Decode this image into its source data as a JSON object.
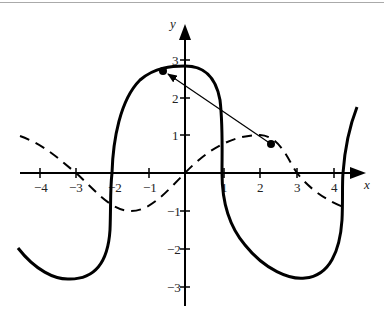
{
  "axes": {
    "x_label": "x",
    "y_label": "y",
    "x_ticks": [
      "−4",
      "−3",
      "−2",
      "−1",
      "1",
      "2",
      "3",
      "4"
    ],
    "y_ticks": [
      "3",
      "2",
      "1",
      "−1",
      "−2",
      "−3"
    ]
  },
  "curves": {
    "solid": {
      "style": "thick solid",
      "color": "#000000"
    },
    "dashed": {
      "style": "dashed",
      "color": "#000000"
    }
  },
  "arrow": {
    "from": [
      2.3,
      0.75
    ],
    "to": [
      -0.6,
      2.7
    ],
    "color": "#000000"
  }
}
